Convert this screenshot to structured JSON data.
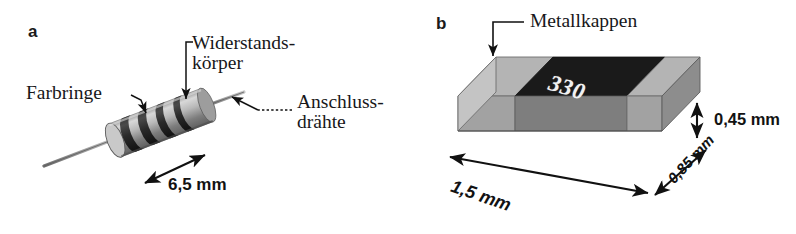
{
  "figure": {
    "background": "#ffffff",
    "panels": [
      {
        "letter": "a",
        "subject": "through-hole-resistor",
        "labels": {
          "color_bands": "Farbringe",
          "resistor_body": "Widerstands-\nkörper",
          "lead_wires": "Anschluss-\ndrähte"
        },
        "dimensions": [
          {
            "name": "length",
            "value": "6,5 mm"
          }
        ],
        "colors": {
          "body_light": "#d2d2d2",
          "body_mid": "#9a9a9a",
          "band_dark": "#2b2b2b",
          "lead_wire": "#8e8e8e"
        }
      },
      {
        "letter": "b",
        "subject": "smd-chip-resistor",
        "labels": {
          "metal_caps": "Metallkappen"
        },
        "marking": "330",
        "dimensions": [
          {
            "name": "length",
            "value": "1,5 mm"
          },
          {
            "name": "width",
            "value": "0,85 mm"
          },
          {
            "name": "height",
            "value": "0,45 mm"
          }
        ],
        "colors": {
          "cap_top": "#b4b4b4",
          "cap_front": "#9c9c9c",
          "body_top": "#1a1a1a",
          "body_front": "#7e7e7e",
          "cap_side": "#c4c4c4",
          "marking_text": "#f2f2f2"
        }
      }
    ],
    "line_color": "#111111",
    "text_color": "#17171a"
  }
}
